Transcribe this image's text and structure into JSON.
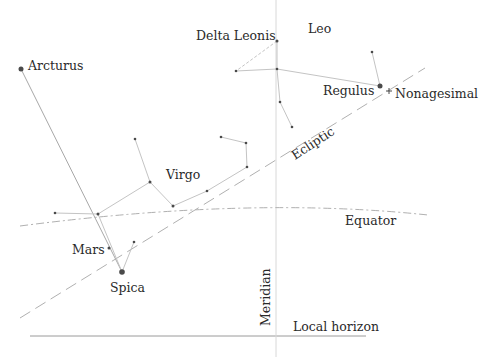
{
  "labels": {
    "arcturus": "Arcturus",
    "delta_leonis": "Delta Leonis",
    "leo": "Leo",
    "regulus": "Regulus",
    "nonagesimal": "Nonagesimal",
    "ecliptic": "Ecliptic",
    "virgo": "Virgo",
    "equator": "Equator",
    "mars": "Mars",
    "spica": "Spica",
    "meridian": "Meridian",
    "local_horizon": "Local horizon"
  },
  "colors": {
    "line": "#b8b8b8",
    "star": "#4a4a4a",
    "text": "#2a2a2a"
  }
}
